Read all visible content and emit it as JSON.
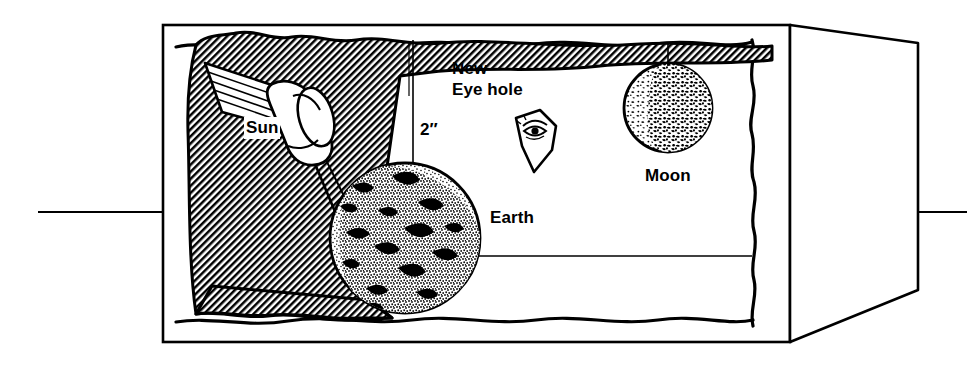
{
  "figure": {
    "background_color": "#ffffff",
    "ink_color": "#000000",
    "width": 967,
    "height": 366
  },
  "labels": {
    "sun": "Sun",
    "new": "New",
    "eye_hole": "Eye hole",
    "dimension": "2″",
    "earth": "Earth",
    "moon": "Moon"
  },
  "elements": {
    "box": {
      "name": "cutaway-box",
      "back_panel_rect": [
        163,
        25,
        627,
        317
      ],
      "right_panel_kind": "perspective-side-wall",
      "inner_edge_style": "hand-drawn wavy"
    },
    "flashlight": {
      "name": "flashlight-sun",
      "role": "light source representing the Sun"
    },
    "shadow": {
      "name": "hatched-shadow-region",
      "hatch_angle_deg": 45,
      "hatch_spacing_px": 4
    },
    "earth_sphere": {
      "name": "earth-sphere",
      "center": [
        405,
        238
      ],
      "radius": 75,
      "texture": "stippled with dark landmasses"
    },
    "moon_sphere": {
      "name": "moon-sphere",
      "center": [
        668,
        108
      ],
      "radius": 44,
      "texture": "mottled craters, dark limb at right"
    },
    "eye_hole": {
      "name": "eye-hole-marker",
      "shape": "irregular kite with eye drawn inside"
    },
    "dimension_line": {
      "name": "dimension-line-2in",
      "from": [
        413,
        40
      ],
      "to": [
        413,
        165
      ],
      "value": "2″"
    },
    "rules": {
      "left_rule_y": 212,
      "right_rule_y": 212
    }
  }
}
